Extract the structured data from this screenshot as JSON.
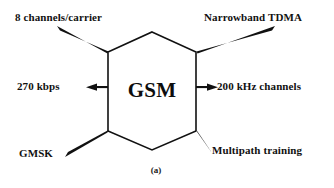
{
  "figure": {
    "caption": "(a)",
    "center_node": {
      "label": "GSM",
      "shape": "hexagon"
    },
    "stroke_color": "#111111",
    "background_color": "#ffffff"
  },
  "features": [
    {
      "id": "8-channels",
      "label": "8 channels/carrier",
      "position": "top-left",
      "connector": "tapered-wedge"
    },
    {
      "id": "narrowband-tdma",
      "label": "Narrowband TDMA",
      "position": "top-right",
      "connector": "tapered-wedge"
    },
    {
      "id": "270-kbps",
      "label": "270 kbps",
      "position": "left",
      "connector": "arrow-left"
    },
    {
      "id": "200-khz-channels",
      "label": "200 kHz channels",
      "position": "right",
      "connector": "arrow-right"
    },
    {
      "id": "gmsk",
      "label": "GMSK",
      "position": "bottom-left",
      "connector": "tapered-wedge"
    },
    {
      "id": "multipath-training",
      "label": "Multipath training",
      "position": "bottom-right",
      "connector": "tapered-wedge"
    }
  ]
}
